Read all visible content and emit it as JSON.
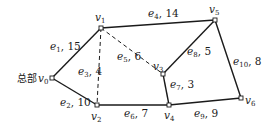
{
  "diagram": {
    "type": "weighted-graph",
    "headquarters_label": "总部",
    "nodes": [
      {
        "id": "v0",
        "name": "v",
        "sub": "0",
        "x": 52,
        "y": 78
      },
      {
        "id": "v1",
        "name": "v",
        "sub": "1",
        "x": 101,
        "y": 28
      },
      {
        "id": "v2",
        "name": "v",
        "sub": "2",
        "x": 97,
        "y": 105
      },
      {
        "id": "v3",
        "name": "v",
        "sub": "3",
        "x": 163,
        "y": 74
      },
      {
        "id": "v4",
        "name": "v",
        "sub": "4",
        "x": 169,
        "y": 105
      },
      {
        "id": "v5",
        "name": "v",
        "sub": "5",
        "x": 215,
        "y": 20
      },
      {
        "id": "v6",
        "name": "v",
        "sub": "6",
        "x": 241,
        "y": 98
      }
    ],
    "edges": [
      {
        "id": "e1",
        "name": "e",
        "sub": "1",
        "weight": "15",
        "from": "v0",
        "to": "v1",
        "style": "solid"
      },
      {
        "id": "e2",
        "name": "e",
        "sub": "2",
        "weight": "10",
        "from": "v0",
        "to": "v2",
        "style": "solid"
      },
      {
        "id": "e3",
        "name": "e",
        "sub": "3",
        "weight": "4",
        "from": "v1",
        "to": "v2",
        "style": "dashed"
      },
      {
        "id": "e4",
        "name": "e",
        "sub": "4",
        "weight": "14",
        "from": "v1",
        "to": "v5",
        "style": "solid"
      },
      {
        "id": "e5",
        "name": "e",
        "sub": "5",
        "weight": "6",
        "from": "v1",
        "to": "v3",
        "style": "dashed"
      },
      {
        "id": "e6",
        "name": "e",
        "sub": "6",
        "weight": "7",
        "from": "v2",
        "to": "v4",
        "style": "solid"
      },
      {
        "id": "e7",
        "name": "e",
        "sub": "7",
        "weight": "3",
        "from": "v3",
        "to": "v4",
        "style": "solid"
      },
      {
        "id": "e8",
        "name": "e",
        "sub": "8",
        "weight": "5",
        "from": "v3",
        "to": "v5",
        "style": "solid"
      },
      {
        "id": "e9",
        "name": "e",
        "sub": "9",
        "weight": "9",
        "from": "v4",
        "to": "v6",
        "style": "solid"
      },
      {
        "id": "e10",
        "name": "e",
        "sub": "10",
        "weight": "8",
        "from": "v5",
        "to": "v6",
        "style": "solid"
      }
    ]
  }
}
